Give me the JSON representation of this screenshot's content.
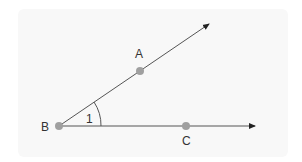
{
  "diagram": {
    "type": "geometry-angle",
    "points": [
      {
        "name": "B",
        "label": "B",
        "x": 59,
        "y": 126
      },
      {
        "name": "A",
        "label": "A",
        "x": 140,
        "y": 71
      },
      {
        "name": "C",
        "label": "C",
        "x": 186,
        "y": 126
      }
    ],
    "rays": [
      {
        "from": "B",
        "through": "A",
        "end": [
          211,
          23
        ]
      },
      {
        "from": "B",
        "through": "C",
        "end": [
          256,
          126
        ]
      }
    ],
    "angle_label": "1",
    "colors": {
      "line": "#555555",
      "point": "#a0a0a0",
      "background": "#f8f8f8",
      "text": "#333333"
    }
  }
}
